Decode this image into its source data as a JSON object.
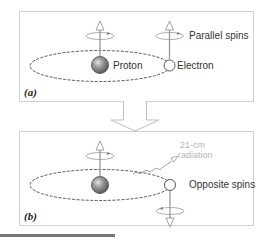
{
  "diagram": {
    "panel_a": {
      "label": "(a)",
      "proton_label": "Proton",
      "electron_label": "Electron",
      "spin_label": "Parallel spins"
    },
    "transition_arrow": "down-arrow",
    "panel_b": {
      "label": "(b)",
      "radiation_label_line1": "21-cm",
      "radiation_label_line2": "radiation",
      "spin_label": "Opposite spins"
    },
    "colors": {
      "box_border": "#cfcfcf",
      "orbit": "#444444",
      "spin_axis": "#999999",
      "proton_fill": "#8a8a8a",
      "radiation": "#b8b8b8",
      "rule": "#777777"
    },
    "icons": [
      "proton-sphere-icon",
      "electron-circle-icon",
      "spin-up-arrow-icon",
      "spin-down-arrow-icon",
      "rotation-ellipse-icon",
      "wavy-radiation-arrow-icon"
    ]
  }
}
